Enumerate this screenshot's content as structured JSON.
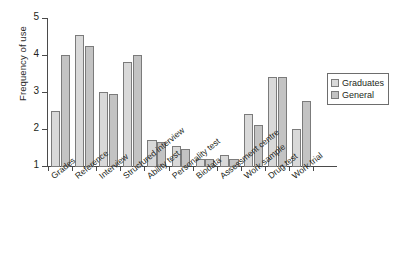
{
  "chart_data": {
    "type": "bar",
    "title": "",
    "xlabel": "",
    "ylabel": "Frequency of use",
    "ylim": [
      1,
      5
    ],
    "yticks": [
      "1",
      "2",
      "3",
      "4",
      "5"
    ],
    "grid": false,
    "legend_position": "right",
    "categories": [
      "Grades",
      "Reference",
      "Interview",
      "Structured interview",
      "Ability test",
      "Personality test",
      "Biodata",
      "Assessment centre",
      "Work sample",
      "Drug test",
      "Work trial"
    ],
    "series": [
      {
        "name": "Graduates",
        "color": "#d9d9d9",
        "values": [
          2.5,
          4.55,
          3.0,
          3.8,
          1.7,
          1.55,
          1.2,
          1.3,
          2.4,
          3.4,
          2.0
        ]
      },
      {
        "name": "General",
        "color": "#c3c3c3",
        "values": [
          4.0,
          4.25,
          2.95,
          4.0,
          1.65,
          1.45,
          1.2,
          1.2,
          2.1,
          3.4,
          2.75
        ]
      }
    ]
  },
  "legend": {
    "items": [
      {
        "label": "Graduates"
      },
      {
        "label": "General"
      }
    ]
  }
}
